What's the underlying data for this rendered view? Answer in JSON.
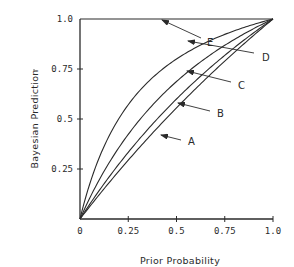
{
  "chart_data": {
    "type": "line",
    "title": "",
    "xlabel": "Prior Probability",
    "ylabel": "Bayesian Prediction",
    "xlim": [
      0,
      1.0
    ],
    "ylim": [
      0,
      1.0
    ],
    "grid": false,
    "legend": "inline arrow labels",
    "x_ticks": [
      {
        "value": 0,
        "label": "0"
      },
      {
        "value": 0.25,
        "label": "0.25"
      },
      {
        "value": 0.5,
        "label": "0.5"
      },
      {
        "value": 0.75,
        "label": "0.75"
      },
      {
        "value": 1.0,
        "label": "1.0"
      }
    ],
    "y_ticks": [
      {
        "value": 0.25,
        "label": "0.25"
      },
      {
        "value": 0.5,
        "label": "0.5"
      },
      {
        "value": 0.75,
        "label": "0.75"
      },
      {
        "value": 1.0,
        "label": "1.0"
      }
    ],
    "x": [
      0,
      0.1,
      0.2,
      0.3,
      0.4,
      0.5,
      0.6,
      0.7,
      0.8,
      0.9,
      1.0
    ],
    "series": [
      {
        "name": "A",
        "likelihood_ratio": 1.25,
        "values": [
          0,
          0.12,
          0.24,
          0.35,
          0.45,
          0.56,
          0.65,
          0.74,
          0.83,
          0.92,
          1.0
        ]
      },
      {
        "name": "B",
        "likelihood_ratio": 1.5,
        "values": [
          0,
          0.14,
          0.27,
          0.39,
          0.5,
          0.6,
          0.69,
          0.78,
          0.86,
          0.93,
          1.0
        ]
      },
      {
        "name": "C",
        "likelihood_ratio": 2.2,
        "values": [
          0,
          0.2,
          0.35,
          0.49,
          0.59,
          0.69,
          0.77,
          0.84,
          0.9,
          0.95,
          1.0
        ]
      },
      {
        "name": "D",
        "likelihood_ratio": 4.0,
        "values": [
          0,
          0.31,
          0.5,
          0.63,
          0.73,
          0.8,
          0.86,
          0.9,
          0.94,
          0.97,
          1.0
        ]
      },
      {
        "name": "E",
        "values": [
          1.0,
          1.0,
          1.0,
          1.0,
          1.0,
          1.0,
          1.0,
          1.0,
          1.0,
          1.0,
          1.0
        ]
      }
    ],
    "annotations": [
      {
        "text": "A",
        "label_pos": [
          188,
          141
        ],
        "arrow_from": [
          181,
          140
        ],
        "arrow_to": [
          161,
          135
        ]
      },
      {
        "text": "B",
        "label_pos": [
          217,
          113
        ],
        "arrow_from": [
          210,
          111
        ],
        "arrow_to": [
          178,
          103
        ]
      },
      {
        "text": "C",
        "label_pos": [
          238,
          85
        ],
        "arrow_from": [
          231,
          82
        ],
        "arrow_to": [
          187,
          71
        ]
      },
      {
        "text": "D",
        "label_pos": [
          262,
          57
        ],
        "arrow_from": [
          254,
          53
        ],
        "arrow_to": [
          188,
          41
        ]
      },
      {
        "text": "E",
        "label_pos": [
          207,
          42
        ],
        "arrow_from": [
          201,
          38
        ],
        "arrow_to": [
          162,
          20
        ]
      }
    ]
  }
}
